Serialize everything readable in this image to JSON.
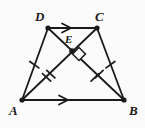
{
  "figure": {
    "name": "trapezoid-with-diagonals",
    "background_color": "#fbfbfb",
    "stroke_color": "#1a1a1a",
    "width": 145,
    "height": 128
  },
  "labels": {
    "a": "A",
    "b": "B",
    "c": "C",
    "d": "D",
    "e": "E"
  },
  "points": {
    "A": {
      "x": 22,
      "y": 100
    },
    "B": {
      "x": 124,
      "y": 100
    },
    "C": {
      "x": 97,
      "y": 28
    },
    "D": {
      "x": 48,
      "y": 28
    },
    "E": {
      "x": 72,
      "y": 51
    }
  },
  "label_positions": {
    "A": {
      "x": 9,
      "y": 105
    },
    "B": {
      "x": 129,
      "y": 105
    },
    "C": {
      "x": 95,
      "y": 11
    },
    "D": {
      "x": 35,
      "y": 11
    },
    "E": {
      "x": 65,
      "y": 35
    }
  },
  "segments": [
    {
      "name": "segment-DC",
      "from": "D",
      "to": "C",
      "marks": "single-arrow"
    },
    {
      "name": "segment-AB",
      "from": "A",
      "to": "B",
      "marks": "single-arrow"
    },
    {
      "name": "segment-AD",
      "from": "A",
      "to": "D",
      "marks": "single-tick"
    },
    {
      "name": "segment-BC",
      "from": "B",
      "to": "C",
      "marks": "single-tick"
    },
    {
      "name": "diagonal-AC",
      "from": "A",
      "to": "C",
      "marks": "double-tick"
    },
    {
      "name": "diagonal-BD",
      "from": "B",
      "to": "D",
      "marks": "double-tick"
    }
  ],
  "markers": {
    "arrow_dc": {
      "x": 67,
      "y": 28,
      "direction": "right"
    },
    "arrow_ab": {
      "x": 64,
      "y": 100,
      "direction": "right"
    },
    "tick_ad": {
      "x": 34.3,
      "y": 64.7
    },
    "tick_bc": {
      "x": 110.4,
      "y": 64.7
    },
    "tick_ac_1": {
      "x": 46.6,
      "y": 77.4
    },
    "tick_ac_2": {
      "x": 50.8,
      "y": 74.1
    },
    "tick_bd_1": {
      "x": 95.0,
      "y": 77.4
    },
    "tick_bd_2": {
      "x": 99.2,
      "y": 74.1
    },
    "right_angle": {
      "x": 79,
      "y": 54,
      "size": 9,
      "rotation": 45
    }
  },
  "annotations": {
    "parallel_pair": "DC parallel to AB",
    "congruent_legs": "AD congruent to BC",
    "congruent_diagonal_halves": "AE congruent to BE",
    "right_angle_at": "E"
  }
}
